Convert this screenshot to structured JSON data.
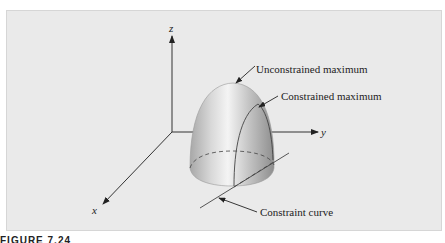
{
  "figure": {
    "axes": {
      "x": "x",
      "y": "y",
      "z": "z"
    },
    "annotations": {
      "unconstrained_max": "Unconstrained maximum",
      "constrained_max": "Constrained maximum",
      "constraint_curve": "Constraint curve"
    },
    "caption_fragment": "FIGURE 7.24",
    "colors": {
      "background": "#eaeaea",
      "surface_light": "#f2f2f2",
      "surface_dark": "#9a9a9a",
      "line": "#333333"
    }
  }
}
